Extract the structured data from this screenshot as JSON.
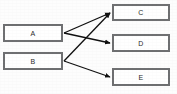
{
  "diagram": {
    "type": "directed-graph",
    "title": "",
    "background_color": "#fdfdfd",
    "node_fill_color": "#ffffff",
    "node_border_color": "#6f7072",
    "edge_color": "#111111",
    "label_color": "#2b2b2b",
    "nodes": [
      {
        "id": "A",
        "label": "A",
        "x": 3,
        "y": 24,
        "width": 60,
        "height": 18,
        "column": "left"
      },
      {
        "id": "B",
        "label": "B",
        "x": 3,
        "y": 52,
        "width": 60,
        "height": 18,
        "column": "left"
      },
      {
        "id": "C",
        "label": "C",
        "x": 112,
        "y": 4,
        "width": 58,
        "height": 17,
        "column": "right"
      },
      {
        "id": "D",
        "label": "D",
        "x": 112,
        "y": 34,
        "width": 58,
        "height": 18,
        "column": "right"
      },
      {
        "id": "E",
        "label": "E",
        "x": 112,
        "y": 68,
        "width": 58,
        "height": 18,
        "column": "right"
      }
    ],
    "edges": [
      {
        "id": "a-c",
        "from": "A",
        "to": "C",
        "x1": 64,
        "y1": 33,
        "x2": 110,
        "y2": 13,
        "arrowhead": "filled-triangle"
      },
      {
        "id": "a-d",
        "from": "A",
        "to": "D",
        "x1": 64,
        "y1": 33,
        "x2": 110,
        "y2": 43,
        "arrowhead": "filled-triangle"
      },
      {
        "id": "b-c",
        "from": "B",
        "to": "C",
        "x1": 64,
        "y1": 61,
        "x2": 110,
        "y2": 13,
        "arrowhead": "filled-triangle"
      },
      {
        "id": "b-e",
        "from": "B",
        "to": "E",
        "x1": 64,
        "y1": 61,
        "x2": 110,
        "y2": 77,
        "arrowhead": "filled-triangle"
      }
    ]
  }
}
